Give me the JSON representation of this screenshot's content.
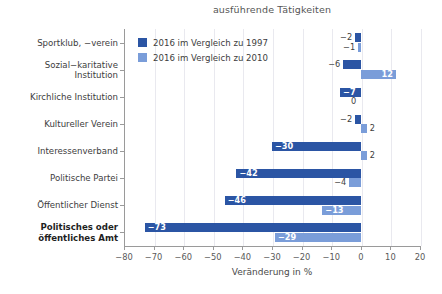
{
  "chart_data": {
    "type": "bar",
    "orientation": "horizontal",
    "title": "ausführende Tätigkeiten",
    "xlabel": "Veränderung in %",
    "ylabel": "",
    "xlim": [
      -80,
      20
    ],
    "xticks": [
      -80,
      -70,
      -60,
      -50,
      -40,
      -30,
      -20,
      -10,
      0,
      10,
      20
    ],
    "xticklabels": [
      "−80",
      "−70",
      "−60",
      "−50",
      "−40",
      "−30",
      "−20",
      "−10",
      "0",
      "10",
      "20"
    ],
    "grid": "vertical",
    "legend_position": "upper-left-inside",
    "categories": [
      "Sportklub, −verein",
      "Sozial−karitative Institution",
      "Kirchliche Institution",
      "Kultureller Verein",
      "Interessenverband",
      "Politische Partei",
      "Öffentlicher Dienst",
      "Politisches oder öffentliches Amt"
    ],
    "category_lines": [
      [
        "Sportklub, −verein"
      ],
      [
        "Sozial−karitative",
        "Institution"
      ],
      [
        "Kirchliche Institution"
      ],
      [
        "Kultureller Verein"
      ],
      [
        "Interessenverband"
      ],
      [
        "Politische Partei"
      ],
      [
        "Öffentlicher Dienst"
      ],
      [
        "Politisches oder",
        "öffentliches Amt"
      ]
    ],
    "category_emphasis": [
      false,
      false,
      false,
      false,
      false,
      false,
      false,
      true
    ],
    "series": [
      {
        "name": "2016 im Vergleich zu 1997",
        "color": "#2b55a4",
        "values": [
          -2,
          -6,
          -7,
          -2,
          -30,
          -42,
          -46,
          -73
        ],
        "labels": [
          "−2",
          "−6",
          "−7",
          "−2",
          "−30",
          "−42",
          "−46",
          "−73"
        ]
      },
      {
        "name": "2016 im Vergleich zu 2010",
        "color": "#7a9dd9",
        "values": [
          -1,
          12,
          0,
          2,
          2,
          -4,
          -13,
          -29
        ],
        "labels": [
          "−1",
          "12",
          "0",
          "2",
          "2",
          "−4",
          "−13",
          "−29"
        ]
      }
    ]
  },
  "legend": {
    "items": [
      {
        "label": "2016 im Vergleich zu 1997",
        "color": "#2b55a4"
      },
      {
        "label": "2016 im Vergleich zu 2010",
        "color": "#7a9dd9"
      }
    ]
  },
  "colors": {
    "series_dark": "#2b55a4",
    "series_light": "#7a9dd9",
    "grid": "#e9e9ef",
    "axis": "#9a9a9a",
    "text": "#3d3d3d"
  }
}
